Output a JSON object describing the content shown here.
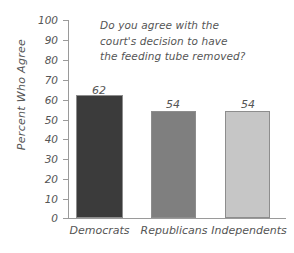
{
  "chart_data": {
    "type": "bar",
    "title": "Do you agree with the court's decision to have the feeding tube removed?",
    "title_lines": [
      "Do you agree with the",
      "court's decision to have",
      "the feeding tube removed?"
    ],
    "xlabel": "",
    "ylabel": "Percent Who Agree",
    "categories": [
      "Democrats",
      "Republicans",
      "Independents"
    ],
    "values": [
      62,
      54,
      54
    ],
    "value_labels": [
      "62",
      "54",
      "54"
    ],
    "ylim": [
      0,
      100
    ],
    "ytick_step": 10,
    "ytick_labels": [
      "100",
      "90",
      "80",
      "70",
      "60",
      "50",
      "40",
      "30",
      "20",
      "10",
      "0"
    ],
    "grid": false,
    "legend": false,
    "legend_position": "none",
    "bar_colors": [
      "#3b3b3b",
      "#7f7f7f",
      "#c6c6c6"
    ],
    "bar_border_color": "#8d8d8d",
    "axis_color": "#9a9a9a",
    "text_color": "#555555",
    "background_color": "#ffffff"
  }
}
